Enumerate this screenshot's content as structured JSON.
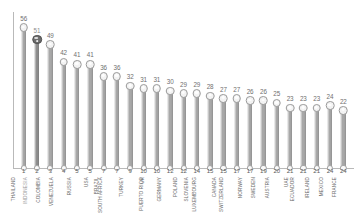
{
  "chart_data": {
    "type": "bar",
    "title": "",
    "subtitle": "",
    "xlabel": "",
    "ylabel": "",
    "ylim": [
      0,
      60
    ],
    "grid": false,
    "legend": null,
    "orientation": "vertical",
    "style": "lollipop",
    "highlight_category": "INDONESIA",
    "colors": {
      "bar": "#a8a8a8",
      "bar_highlight": "#8f8f8f",
      "marker_fill": "#f3f3f3",
      "marker_highlight_fill": "#6e6e6e",
      "value_label": "#6f6f6f",
      "axis": "#b9b9b9",
      "category_label": "#6a6a6a",
      "highlight_label": "#9b9b9b",
      "background": "#ffffff"
    },
    "categories": [
      "THAILAND",
      "INDONESIA",
      "COLOMBIA",
      "VENEZUELA",
      "RUSSIA",
      "USA",
      "BRAZIL",
      "SOUTH AFRICA",
      "TURKEY",
      "UK",
      "PUERTO RICO",
      "GERMANY",
      "POLAND",
      "SLOVENIA",
      "LUXEMBOURG",
      "CANADA",
      "SWITZERLAND",
      "NORWAY",
      "SWEDEN",
      "AUSTRIA",
      "UAE",
      "ECUADOR",
      "IRELAND",
      "MEXICO",
      "FRANCE"
    ],
    "ranks": [
      "1",
      "2",
      "3",
      "4",
      "5",
      "5",
      "7",
      "7",
      "9",
      "10",
      "10",
      "12",
      "12",
      "14",
      "15",
      "15",
      "17",
      "17",
      "19",
      "20",
      "21",
      "21",
      "21",
      "24",
      "24"
    ],
    "values": [
      56,
      51,
      49,
      42,
      41,
      41,
      36,
      36,
      32,
      31,
      31,
      30,
      29,
      29,
      28,
      27,
      27,
      26,
      26,
      25,
      23,
      23,
      23,
      24,
      22
    ],
    "value_labels": [
      "56",
      "51",
      "49",
      "42",
      "41",
      "41",
      "36",
      "36",
      "32",
      "31",
      "31",
      "30",
      "29",
      "29",
      "28",
      "27",
      "27",
      "26",
      "26",
      "25",
      "23",
      "23",
      "23",
      "24",
      "22"
    ]
  }
}
